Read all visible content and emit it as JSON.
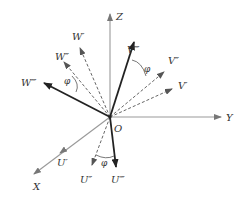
{
  "diagram": {
    "type": "coordinate-rotation-vectors",
    "origin": {
      "label": "O",
      "x": 110,
      "y": 117
    },
    "colors": {
      "axis": "#888888",
      "dashed": "#666666",
      "bold": "#222222",
      "arc": "#555555",
      "text": "#333333"
    },
    "axes": [
      {
        "id": "z",
        "label": "Z",
        "x2": 110,
        "y2": 14,
        "lx": 116,
        "ly": 20
      },
      {
        "id": "y",
        "label": "Y",
        "x2": 221,
        "y2": 117,
        "lx": 226,
        "ly": 121
      },
      {
        "id": "x",
        "label": "X",
        "x2": 34,
        "y2": 174,
        "lx": 33,
        "ly": 190
      }
    ],
    "vectors": [
      {
        "id": "u1",
        "label": "U′",
        "style": "solid-thin",
        "x2": 60,
        "y2": 153,
        "lx": 57,
        "ly": 166
      },
      {
        "id": "u2",
        "label": "U″",
        "style": "dashed",
        "x2": 92,
        "y2": 165,
        "lx": 80,
        "ly": 183
      },
      {
        "id": "u3",
        "label": "U‴",
        "style": "bold",
        "x2": 116,
        "y2": 167,
        "lx": 111,
        "ly": 183
      },
      {
        "id": "w1",
        "label": "W′",
        "style": "dashed",
        "x2": 80,
        "y2": 48,
        "lx": 72,
        "ly": 40
      },
      {
        "id": "w2",
        "label": "W″",
        "style": "dashed",
        "x2": 64,
        "y2": 62,
        "lx": 55,
        "ly": 60
      },
      {
        "id": "w3",
        "label": "W‴",
        "style": "bold",
        "x2": 44,
        "y2": 83,
        "lx": 21,
        "ly": 86
      },
      {
        "id": "v1",
        "label": "V′",
        "style": "dashed",
        "x2": 172,
        "y2": 89,
        "lx": 178,
        "ly": 89
      },
      {
        "id": "v2",
        "label": "V″",
        "style": "dashed",
        "x2": 164,
        "y2": 72,
        "lx": 168,
        "ly": 64
      },
      {
        "id": "v3",
        "label": "V‴",
        "style": "bold",
        "x2": 134,
        "y2": 42,
        "lx": 127,
        "ly": 53
      }
    ],
    "angles": [
      {
        "label": "φ",
        "lx": 101,
        "ly": 166,
        "arc": "M 96 155 Q 106 160 114 156"
      },
      {
        "label": "φ",
        "lx": 64,
        "ly": 84,
        "arc": "M 72 76 Q 80 84 76 92"
      },
      {
        "label": "φ",
        "lx": 144,
        "ly": 72,
        "arc": "M 132 60 Q 142 62 146 76"
      }
    ]
  }
}
